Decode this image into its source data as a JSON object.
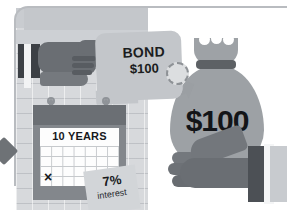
{
  "illustration": {
    "title": "Bond investment illustration",
    "style": "grayscale flat infographic"
  },
  "bond_tag": {
    "name": "bond-tag",
    "line1": "BOND",
    "line2": "$100",
    "seal_name": "official-seal"
  },
  "calendar": {
    "name": "calendar",
    "term_label": "10 YEARS",
    "marked_cell": "×"
  },
  "interest_note": {
    "name": "interest-sticky-note",
    "rate": "7%",
    "label": "interest"
  },
  "money_bag": {
    "name": "money-bag",
    "amount": "$100"
  },
  "hands": {
    "pointing_hand": "pointing-hand",
    "holding_hand": "holding-hand"
  },
  "colors": {
    "frame_border": "#b9bcc0",
    "wall": "#d7d9dc",
    "tag": "#c3c6ca",
    "bag": "#9da1a5",
    "hand": "#6a6e73",
    "dark_block": "#3c4045",
    "text": "#17191c",
    "sheet": "#fdfdfd",
    "note": "#d2d5d8"
  }
}
